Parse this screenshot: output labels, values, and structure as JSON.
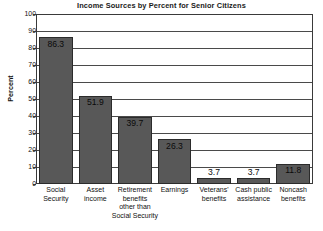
{
  "chart_data": {
    "type": "bar",
    "title": "Income Sources by Percent for Senior Citizens",
    "xlabel": "",
    "ylabel": "Percent",
    "ylim": [
      0,
      100
    ],
    "ytick_step": 10,
    "grid": true,
    "legend": "none",
    "categories": [
      "Social Security",
      "Asset income",
      "Retirement benefits other than Social Security",
      "Earnings",
      "Veterans' benefits",
      "Cash public assistance",
      "Noncash benefits"
    ],
    "values": [
      86.3,
      51.9,
      39.7,
      26.3,
      3.7,
      3.7,
      11.8
    ],
    "value_labels": [
      "86.3",
      "51.9",
      "39.7",
      "26.3",
      "3.7",
      "3.7",
      "11.8"
    ],
    "bar_color": "#585858",
    "bar_edge_color": "#2b2b2b",
    "axis_color": "#3a3a3a",
    "background_color": "#ffffff"
  },
  "axis": {
    "y_ticks": [
      "100",
      "90",
      "80",
      "70",
      "60",
      "50",
      "40",
      "30",
      "20",
      "10",
      "0"
    ]
  },
  "category_lines": [
    [
      "Social",
      "Security"
    ],
    [
      "Asset",
      "income"
    ],
    [
      "Retirement",
      "benefits",
      "other than",
      "Social Security"
    ],
    [
      "Earnings"
    ],
    [
      "Veterans'",
      "benefits"
    ],
    [
      "Cash public",
      "assistance"
    ],
    [
      "Noncash",
      "benefits"
    ]
  ]
}
